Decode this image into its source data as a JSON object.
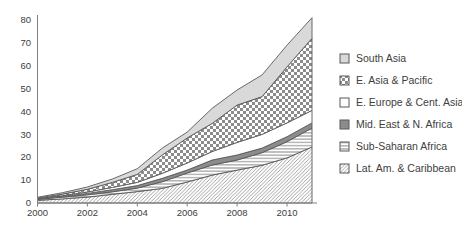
{
  "chart_data": {
    "type": "area",
    "stacked": true,
    "title": "",
    "xlabel": "",
    "ylabel": "",
    "x": [
      2000,
      2001,
      2002,
      2003,
      2004,
      2005,
      2006,
      2007,
      2008,
      2009,
      2010,
      2011
    ],
    "series": [
      {
        "name": "Lat. Am. & Caribbean",
        "pattern": "diagonal-up",
        "values": [
          1.2,
          1.8,
          2.6,
          3.8,
          5.0,
          6.4,
          9.2,
          12.2,
          14.4,
          16.5,
          19.7,
          24.5
        ]
      },
      {
        "name": "Sub-Saharan Africa",
        "pattern": "horizontal-lines",
        "values": [
          0.4,
          0.8,
          1.0,
          1.1,
          1.5,
          2.9,
          3.9,
          4.4,
          4.4,
          5.5,
          7.1,
          8.3
        ]
      },
      {
        "name": "Mid. East & N. Africa",
        "pattern": "solid-gray",
        "values": [
          0.2,
          0.3,
          0.6,
          0.9,
          1.1,
          1.5,
          1.3,
          2.2,
          2.2,
          2.0,
          2.2,
          2.2
        ]
      },
      {
        "name": "E. Europe & Cent. Asia",
        "pattern": "solid-white",
        "values": [
          0.1,
          0.3,
          0.6,
          1.0,
          1.4,
          2.2,
          3.1,
          3.7,
          5.5,
          6.0,
          6.0,
          5.5
        ]
      },
      {
        "name": "E. Asia & Pacific",
        "pattern": "checkerboard",
        "values": [
          0.3,
          0.7,
          1.2,
          2.2,
          3.5,
          8.0,
          10.9,
          12.3,
          16.3,
          16.5,
          24.5,
          31.5
        ]
      },
      {
        "name": "South Asia",
        "pattern": "solid-lightgray",
        "values": [
          0.3,
          0.6,
          1.0,
          1.5,
          2.5,
          3.0,
          2.6,
          6.6,
          6.6,
          9.5,
          9.5,
          9.0
        ]
      }
    ],
    "legend_order": [
      "South Asia",
      "E. Asia & Pacific",
      "E. Europe & Cent. Asia",
      "Mid. East & N. Africa",
      "Sub-Saharan Africa",
      "Lat. Am. & Caribbean"
    ],
    "legend_position": "right",
    "grid": false,
    "xlim": [
      2000,
      2011
    ],
    "ylim": [
      0,
      80
    ],
    "x_ticks": [
      2000,
      2002,
      2004,
      2006,
      2008,
      2010
    ],
    "y_ticks": [
      0,
      10,
      20,
      30,
      40,
      50,
      60,
      70,
      80
    ],
    "colors": {
      "background": "#ffffff",
      "outline": "#595959",
      "axis": "#808080",
      "text": "#404040",
      "pattern_gray": "#8c8c8c",
      "light_gray": "#d9d9d9",
      "white": "#ffffff"
    }
  }
}
